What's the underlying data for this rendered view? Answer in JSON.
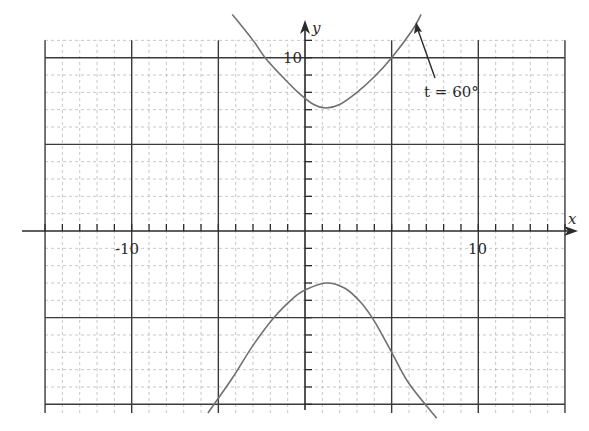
{
  "chart_data": {
    "type": "line",
    "title": "",
    "xlabel": "x",
    "ylabel": "y",
    "xlim": [
      -15,
      15
    ],
    "ylim": [
      -10.5,
      11
    ],
    "grid": true,
    "major_grid_step": 5,
    "minor_grid_step": 1,
    "x_tick_labels": [
      "-10",
      "10"
    ],
    "y_tick_labels": [
      "10"
    ],
    "annotation": {
      "text": "t = 60°",
      "points_to": [
        7,
        12.5
      ]
    },
    "series": [
      {
        "name": "upper branch",
        "points": [
          [
            -4.2,
            12.5
          ],
          [
            -3,
            11
          ],
          [
            -2.3,
            10
          ],
          [
            -1.4,
            9
          ],
          [
            -0.4,
            8
          ],
          [
            0.5,
            7.3
          ],
          [
            1.2,
            7.1
          ],
          [
            2,
            7.3
          ],
          [
            3,
            8
          ],
          [
            4,
            8.9
          ],
          [
            5,
            10
          ],
          [
            6.2,
            11.6
          ],
          [
            6.7,
            12.5
          ]
        ]
      },
      {
        "name": "lower branch",
        "points": [
          [
            -5.6,
            -10.5
          ],
          [
            -4.2,
            -8.5
          ],
          [
            -3,
            -6.6
          ],
          [
            -1.8,
            -5
          ],
          [
            -0.6,
            -3.8
          ],
          [
            0,
            -3.4
          ],
          [
            1.2,
            -3
          ],
          [
            2.3,
            -3.3
          ],
          [
            3.2,
            -4.1
          ],
          [
            4,
            -5.2
          ],
          [
            5,
            -7
          ],
          [
            6,
            -8.8
          ],
          [
            7.6,
            -10.8
          ]
        ]
      }
    ]
  },
  "labels": {
    "x_axis": "x",
    "y_axis": "y",
    "tick_neg10": "-10",
    "tick_pos10_x": "10",
    "tick_pos10_y": "10",
    "annotation": "t = 60°"
  }
}
